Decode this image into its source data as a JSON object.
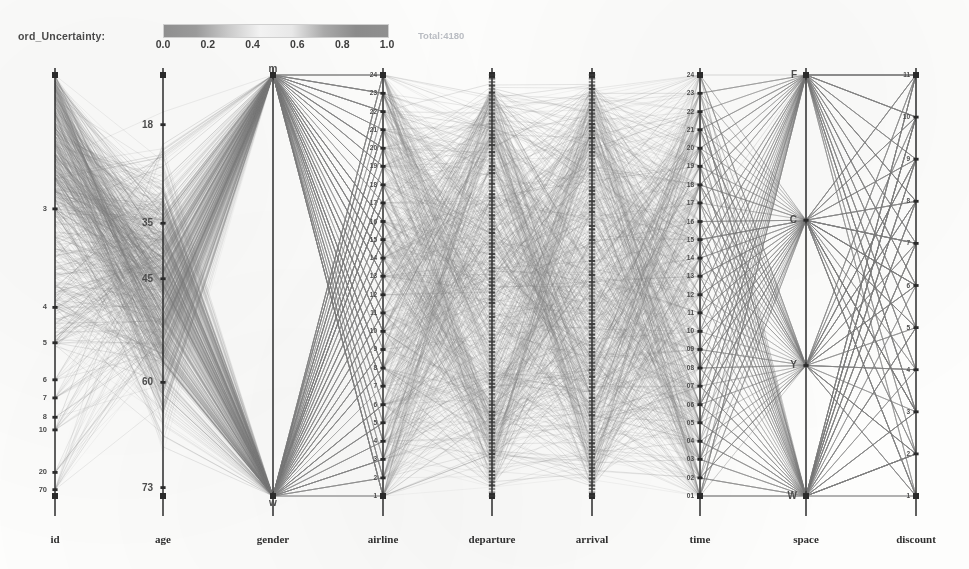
{
  "legend": {
    "label": "ord_Uncertainty:",
    "ticks": [
      "0.0",
      "0.2",
      "0.4",
      "0.6",
      "0.8",
      "1.0"
    ],
    "total": "Total:4180",
    "colorbar_stops": [
      "#8f8f8f",
      "#9a9a9a",
      "#c9c9c9",
      "#f2f2f2",
      "#e8e8e8",
      "#a9a9a9",
      "#8b8b8b",
      "#8f8f8f"
    ]
  },
  "colors": {
    "axis": "#2b2b2b",
    "line": "#7d7d7d",
    "tick_text": "#4c4c4c",
    "title_text": "#2f2f2f"
  },
  "chart_data": {
    "type": "line",
    "title": "",
    "subtitle": "",
    "plot_kind": "parallel-coordinates",
    "record_count": 4180,
    "grid": false,
    "legend_position": "top-left",
    "color_encoding": "Record_Uncertainty",
    "color_range": [
      0.0,
      1.0
    ],
    "axes": [
      {
        "name": "id",
        "x": 55,
        "scale": "ordinal",
        "tick_labels": [
          "3",
          "4",
          "5",
          "6",
          "7",
          "8",
          "10",
          "20",
          "70"
        ],
        "tick_positions": [
          0.318,
          0.552,
          0.636,
          0.724,
          0.767,
          0.813,
          0.843,
          0.944,
          0.985
        ],
        "top_value": "",
        "bottom_value": ""
      },
      {
        "name": "age",
        "x": 163,
        "scale": "linear",
        "tick_labels": [
          "18",
          "35",
          "45",
          "60",
          "73"
        ],
        "tick_positions": [
          0.118,
          0.352,
          0.484,
          0.73,
          0.98
        ],
        "top_value": "18",
        "bottom_value": "73"
      },
      {
        "name": "gender",
        "x": 273,
        "scale": "categorical",
        "tick_labels": [
          "m",
          "w"
        ],
        "tick_positions": [
          0.0,
          1.0
        ],
        "top_value": "m",
        "bottom_value": "w"
      },
      {
        "name": "airline",
        "x": 383,
        "scale": "ordinal",
        "tick_labels": [
          "24",
          "23",
          "22",
          "21",
          "20",
          "19",
          "18",
          "17",
          "16",
          "15",
          "14",
          "13",
          "12",
          "11",
          "10",
          "9",
          "8",
          "7",
          "6",
          "5",
          "4",
          "3",
          "2",
          "1"
        ],
        "tick_positions": [
          0.0,
          0.0435,
          0.087,
          0.13,
          0.174,
          0.217,
          0.261,
          0.304,
          0.348,
          0.391,
          0.435,
          0.478,
          0.522,
          0.565,
          0.609,
          0.652,
          0.696,
          0.739,
          0.783,
          0.826,
          0.87,
          0.913,
          0.957,
          1.0
        ],
        "top_value": "24",
        "bottom_value": "1"
      },
      {
        "name": "departure",
        "x": 492,
        "scale": "time-dense",
        "tick_labels": [],
        "tick_positions": [],
        "top_value": "",
        "bottom_value": ""
      },
      {
        "name": "arrival",
        "x": 592,
        "scale": "time-dense",
        "tick_labels": [],
        "tick_positions": [],
        "top_value": "",
        "bottom_value": ""
      },
      {
        "name": "time",
        "x": 700,
        "scale": "ordinal",
        "tick_labels": [
          "24",
          "23",
          "22",
          "21",
          "20",
          "19",
          "18",
          "17",
          "16",
          "15",
          "14",
          "13",
          "12",
          "11",
          "10",
          "09",
          "08",
          "07",
          "06",
          "05",
          "04",
          "03",
          "02",
          "01"
        ],
        "tick_positions": [
          0.0,
          0.0435,
          0.087,
          0.13,
          0.174,
          0.217,
          0.261,
          0.304,
          0.348,
          0.391,
          0.435,
          0.478,
          0.522,
          0.565,
          0.609,
          0.652,
          0.696,
          0.739,
          0.783,
          0.826,
          0.87,
          0.913,
          0.957,
          1.0
        ],
        "top_value": "24",
        "bottom_value": "01"
      },
      {
        "name": "space",
        "x": 806,
        "scale": "categorical",
        "tick_labels": [
          "F",
          "C",
          "Y",
          "W"
        ],
        "tick_positions": [
          0.0,
          0.345,
          0.69,
          1.0
        ],
        "top_value": "F",
        "bottom_value": "W"
      },
      {
        "name": "discount",
        "x": 916,
        "scale": "ordinal",
        "tick_labels": [
          "11",
          "10",
          "9",
          "8",
          "7",
          "6",
          "5",
          "4",
          "3",
          "2",
          "1"
        ],
        "tick_positions": [
          0.0,
          0.1,
          0.2,
          0.3,
          0.4,
          0.5,
          0.6,
          0.7,
          0.8,
          0.9,
          1.0
        ],
        "top_value": "11",
        "bottom_value": "1"
      }
    ],
    "axis_titles": [
      "id",
      "age",
      "gender",
      "airline",
      "departure",
      "arrival",
      "time",
      "space",
      "discount"
    ],
    "xlabel": "",
    "ylabel": "",
    "ylim": [
      0,
      1
    ]
  }
}
